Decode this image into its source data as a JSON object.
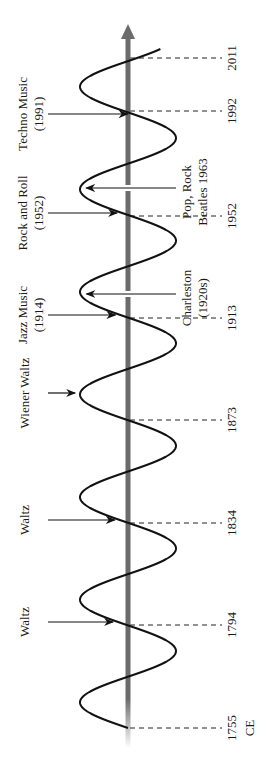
{
  "chart_data": {
    "type": "diagram",
    "title": "",
    "axis": {
      "direction": "up",
      "unit_label": "CE",
      "color": "#6b6b6b"
    },
    "wave": {
      "color": "#111111",
      "center_x": 128,
      "amplitude": 48,
      "period_px": 102.6,
      "start_y": 728,
      "end_y": 49
    },
    "years": [
      {
        "label": "2011",
        "y": 58
      },
      {
        "label": "1992",
        "y": 111
      },
      {
        "label": "1952",
        "y": 216
      },
      {
        "label": "1913",
        "y": 318
      },
      {
        "label": "1873",
        "y": 420
      },
      {
        "label": "1834",
        "y": 523
      },
      {
        "label": "1794",
        "y": 625
      },
      {
        "label": "1755",
        "y": 728
      }
    ],
    "era_suffix": "CE",
    "left_events": [
      {
        "lines": [
          "Techno Music",
          "(1991)"
        ],
        "y": 114
      },
      {
        "lines": [
          "Rock and Roll",
          "(1952)"
        ],
        "y": 213
      },
      {
        "lines": [
          "Jazz Music",
          "(1914)"
        ],
        "y": 315
      },
      {
        "lines": [
          "Wiener Waltz"
        ],
        "y": 393
      },
      {
        "lines": [
          "Waltz"
        ],
        "y": 520
      },
      {
        "lines": [
          "Waltz"
        ],
        "y": 622
      }
    ],
    "right_events": [
      {
        "lines": [
          "Pop, Rock",
          "Beatles 1963"
        ],
        "y": 188
      },
      {
        "lines": [
          "Charleston",
          "(1920s)"
        ],
        "y": 294
      }
    ]
  }
}
